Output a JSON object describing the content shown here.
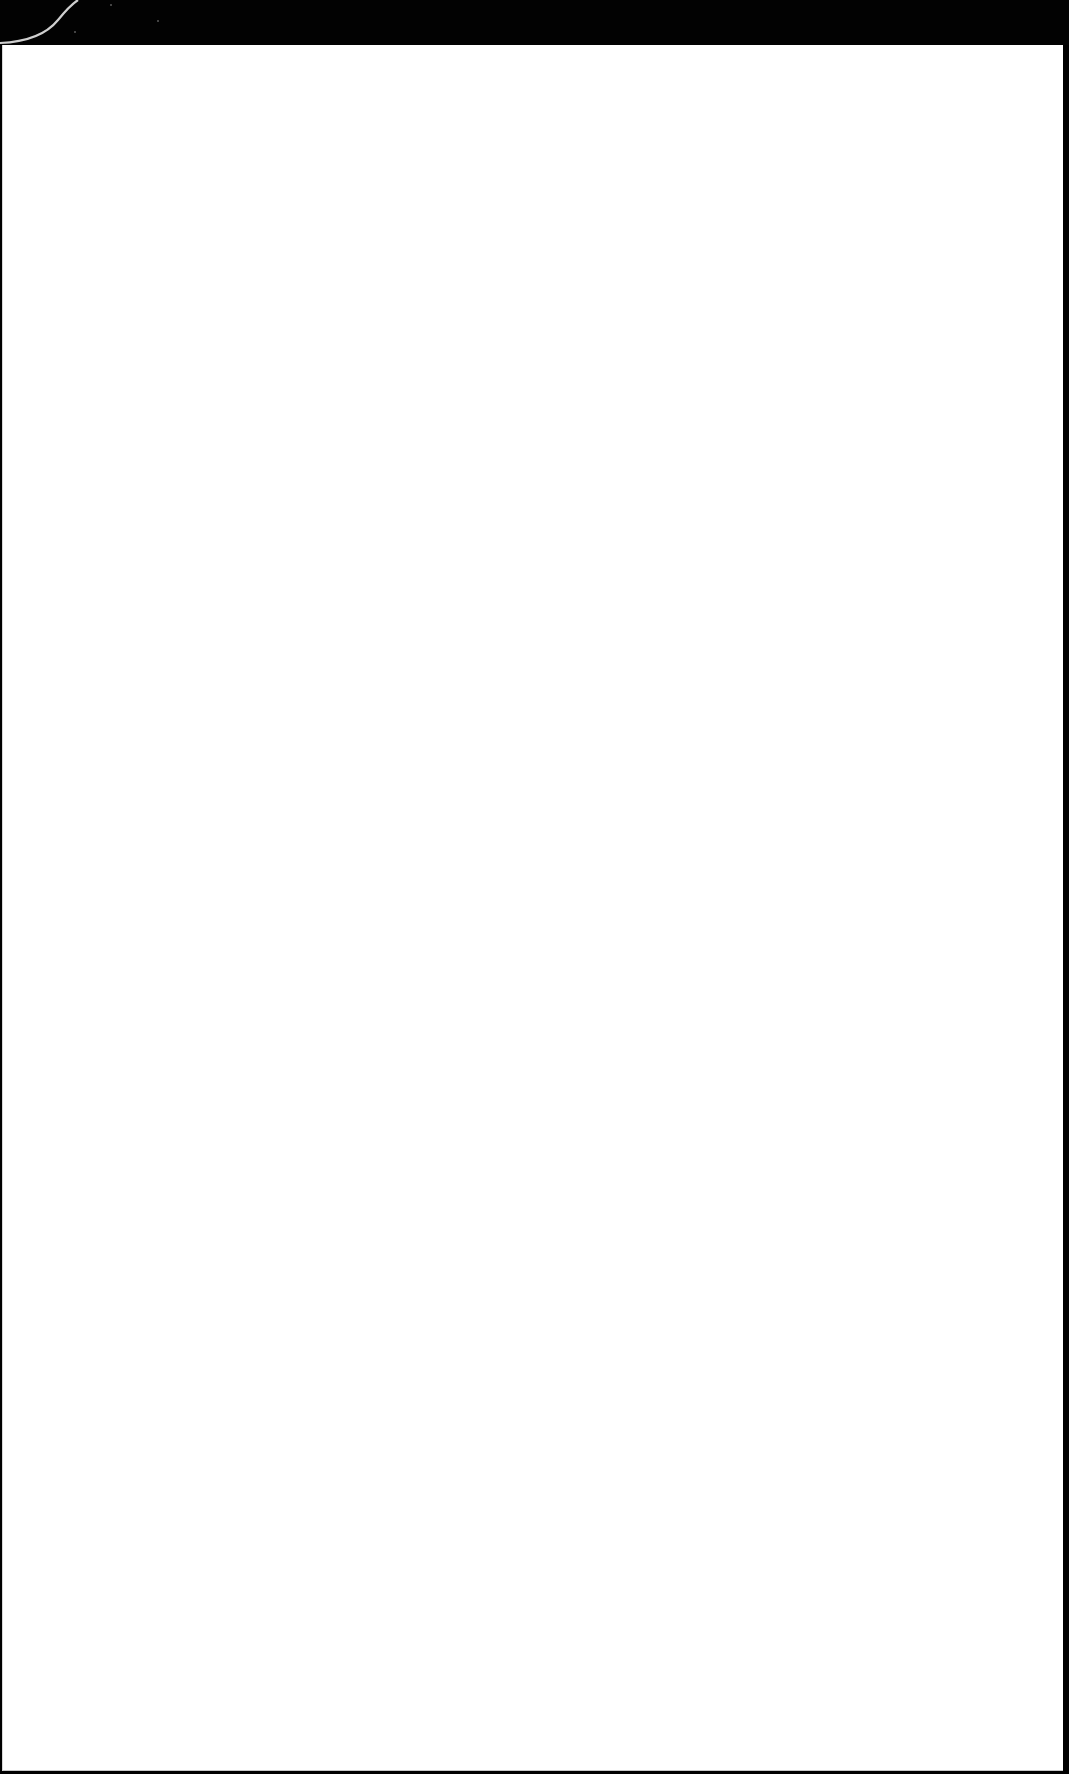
{
  "page": {
    "background_color": "#ffffff",
    "frame_color": "#000000",
    "content": ""
  }
}
